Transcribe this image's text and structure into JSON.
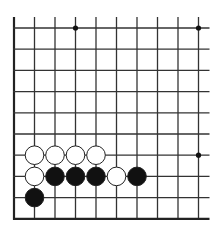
{
  "board": {
    "cols": 10,
    "rows": 10,
    "x_positions": [
      14,
      34.5,
      55,
      75.5,
      96,
      116.5,
      137,
      157.5,
      178,
      198.5
    ],
    "y_positions": [
      28,
      49.2,
      70.4,
      91.6,
      112.8,
      134,
      155.2,
      176.4,
      197.6,
      218.8
    ],
    "open_top": true,
    "open_right": true,
    "edge_left": true,
    "edge_bottom": true,
    "line_color": "#333333",
    "edge_color": "#222222",
    "star_points": [
      {
        "col": 3,
        "row": 0
      },
      {
        "col": 9,
        "row": 0
      },
      {
        "col": 9,
        "row": 6
      }
    ]
  },
  "stones": [
    {
      "color": "white",
      "col": 1,
      "row": 6
    },
    {
      "color": "white",
      "col": 2,
      "row": 6
    },
    {
      "color": "white",
      "col": 3,
      "row": 6
    },
    {
      "color": "white",
      "col": 4,
      "row": 6
    },
    {
      "color": "white",
      "col": 1,
      "row": 7
    },
    {
      "color": "black",
      "col": 2,
      "row": 7
    },
    {
      "color": "black",
      "col": 3,
      "row": 7
    },
    {
      "color": "black",
      "col": 4,
      "row": 7
    },
    {
      "color": "white",
      "col": 5,
      "row": 7
    },
    {
      "color": "black",
      "col": 6,
      "row": 7
    },
    {
      "color": "black",
      "col": 1,
      "row": 8
    }
  ],
  "colors": {
    "black_stone": "#111111",
    "white_stone": "#ffffff",
    "stone_outline": "#222222"
  }
}
